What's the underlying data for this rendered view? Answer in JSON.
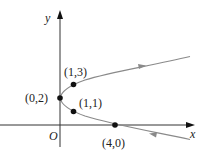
{
  "diagram": {
    "type": "parametric-curve",
    "equation": "x = (y-2)^2",
    "axes": {
      "x_label": "x",
      "y_label": "y",
      "origin_label": "O"
    },
    "points": [
      {
        "label": "(0,2)",
        "x": 0,
        "y": 2
      },
      {
        "label": "(1,3)",
        "x": 1,
        "y": 3
      },
      {
        "label": "(1,1)",
        "x": 1,
        "y": 1
      },
      {
        "label": "(4,0)",
        "x": 4,
        "y": 0
      }
    ],
    "direction": "upper branch arrow points right (away from vertex); lower branch arrow points left (toward vertex)",
    "colors": {
      "axis": "#333333",
      "curve": "#888888",
      "point": "#111111"
    }
  }
}
